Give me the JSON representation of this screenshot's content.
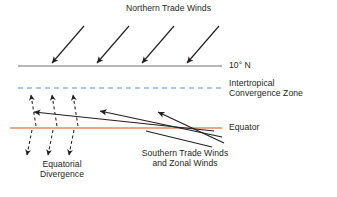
{
  "diagram": {
    "title": "Northern Trade Winds",
    "width": 337,
    "height": 197,
    "background_color": "#ffffff",
    "text_color": "#231f20"
  },
  "labels": {
    "northern_trade_winds": "Northern Trade Winds",
    "ten_degrees_north": "10° N",
    "itcz": "Intertropical\nConvergence Zone",
    "equator": "Equator",
    "equatorial_divergence": "Equatorial\nDivergence",
    "southern_trade_winds": "Southern Trade Winds\nand Zonal Winds"
  },
  "reference_lines": [
    {
      "name": "ten-degrees-north-line",
      "label": "10° N",
      "style": "solid",
      "color": "#6d6e70",
      "y": 66,
      "x_start": 18,
      "x_end": 222,
      "stroke_width": 1.2
    },
    {
      "name": "itcz-line",
      "label": "Intertropical Convergence Zone",
      "style": "dashed",
      "color": "#8fb9dd",
      "y": 88,
      "x_start": 18,
      "x_end": 222,
      "stroke_width": 1.4,
      "dash_pattern": "5 4"
    },
    {
      "name": "equator-line",
      "label": "Equator",
      "style": "solid",
      "color": "#e8a88b",
      "y": 128,
      "x_start": 10,
      "x_end": 222,
      "stroke_width": 2.2
    }
  ],
  "arrow_groups": [
    {
      "name": "northern-trade-wind-arrows",
      "label": "Northern Trade Winds",
      "style": "solid",
      "color": "#231f20",
      "direction": "southwest",
      "count": 4,
      "arrows": [
        {
          "x1": 84,
          "y1": 26,
          "x2": 52,
          "y2": 63
        },
        {
          "x1": 129,
          "y1": 26,
          "x2": 97,
          "y2": 63
        },
        {
          "x1": 174,
          "y1": 26,
          "x2": 142,
          "y2": 63
        },
        {
          "x1": 219,
          "y1": 26,
          "x2": 187,
          "y2": 63
        }
      ]
    },
    {
      "name": "southern-trade-wind-arrows",
      "label": "Southern Trade Winds and Zonal Winds",
      "style": "solid",
      "color": "#231f20",
      "direction": "northwest",
      "count": 4,
      "arrows": [
        {
          "x1": 214,
          "y1": 131,
          "x2": 34,
          "y2": 112,
          "head": true
        },
        {
          "x1": 222,
          "y1": 137,
          "x2": 100,
          "y2": 111,
          "head": true
        },
        {
          "x1": 224,
          "y1": 143,
          "x2": 158,
          "y2": 112,
          "head": true
        },
        {
          "x1": 212,
          "y1": 147,
          "x2": 146,
          "y2": 131,
          "head": false
        }
      ]
    },
    {
      "name": "equatorial-divergence-up-arrows",
      "label": "Equatorial Divergence",
      "style": "dashed",
      "color": "#231f20",
      "direction": "north",
      "count": 3,
      "arrows": [
        {
          "x1": 36,
          "y1": 126,
          "x2": 31,
          "y2": 95
        },
        {
          "x1": 57,
          "y1": 126,
          "x2": 52,
          "y2": 95
        },
        {
          "x1": 78,
          "y1": 126,
          "x2": 73,
          "y2": 95
        }
      ]
    },
    {
      "name": "equatorial-divergence-down-arrows",
      "label": "Equatorial Divergence",
      "style": "dashed",
      "color": "#231f20",
      "direction": "south",
      "count": 3,
      "arrows": [
        {
          "x1": 32,
          "y1": 130,
          "x2": 27,
          "y2": 155
        },
        {
          "x1": 53,
          "y1": 130,
          "x2": 48,
          "y2": 155
        },
        {
          "x1": 74,
          "y1": 130,
          "x2": 69,
          "y2": 155
        }
      ]
    }
  ]
}
